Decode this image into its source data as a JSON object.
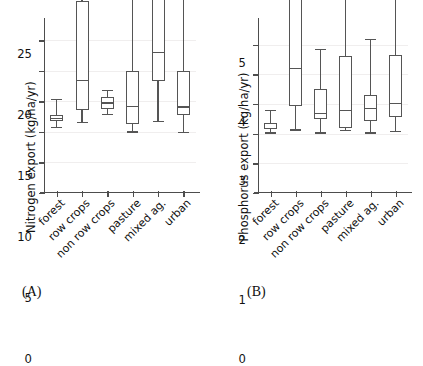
{
  "figure": {
    "background": "#ffffff",
    "line_color": "#555555",
    "grid_color": "#f0eeee"
  },
  "panels": [
    {
      "caption": "(A)",
      "ylabel": "Nitrogen export (kg/ha/yr)",
      "yticks": [
        "0",
        "5",
        "10",
        "15",
        "20",
        "25"
      ]
    },
    {
      "caption": "(B)",
      "ylabel": "Phosphorus export (kg/ha/yr)",
      "yticks": [
        "0",
        "1",
        "2",
        "3",
        "4",
        "5"
      ]
    }
  ],
  "chart_data": [
    {
      "type": "boxplot",
      "panel": "(A)",
      "title": "",
      "xlabel": "",
      "ylabel": "Nitrogen export (kg/ha/yr)",
      "ylim": [
        0,
        27.2
      ],
      "yticks": [
        0,
        5,
        10,
        15,
        20,
        25
      ],
      "grid": true,
      "categories": [
        "forest",
        "row crops",
        "non row crops",
        "pasture",
        "mixed ag.",
        "urban"
      ],
      "boxes": [
        {
          "category": "forest",
          "whisker_low": 1.05,
          "q1": 1.95,
          "median": 2.45,
          "q3": 2.95,
          "whisker_high": 5.55,
          "annotation": ""
        },
        {
          "category": "row crops",
          "whisker_low": 1.8,
          "q1": 3.7,
          "median": 8.7,
          "q3": 21.6,
          "whisker_high": 79.6,
          "annotation": "79.6"
        },
        {
          "category": "non row crops",
          "whisker_low": 3.15,
          "q1": 3.95,
          "median": 5.0,
          "q3": 5.9,
          "whisker_high": 7.0,
          "annotation": ""
        },
        {
          "category": "pasture",
          "whisker_low": 0.25,
          "q1": 1.55,
          "median": 4.5,
          "q3": 10.2,
          "whisker_high": 30.85,
          "annotation": "30.85"
        },
        {
          "category": "mixed ag.",
          "whisker_low": 2.0,
          "q1": 8.5,
          "median": 13.3,
          "q3": 24.8,
          "whisker_high": 41.5,
          "annotation": "41.50"
        },
        {
          "category": "urban",
          "whisker_low": 0.15,
          "q1": 2.95,
          "median": 4.35,
          "q3": 10.1,
          "whisker_high": 38.47,
          "annotation": "38.47"
        }
      ]
    },
    {
      "type": "boxplot",
      "panel": "(B)",
      "title": "",
      "xlabel": "",
      "ylabel": "Phosphorus export (kg/ha/yr)",
      "ylim": [
        0,
        5.6
      ],
      "yticks": [
        0,
        1,
        2,
        3,
        4,
        5
      ],
      "grid": true,
      "categories": [
        "forest",
        "row crops",
        "non row crops",
        "pasture",
        "mixed ag.",
        "urban"
      ],
      "boxes": [
        {
          "category": "forest",
          "whisker_low": 0.02,
          "q1": 0.12,
          "median": 0.18,
          "q3": 0.34,
          "whisker_high": 0.78,
          "annotation": ""
        },
        {
          "category": "row crops",
          "whisker_low": 0.12,
          "q1": 0.9,
          "median": 2.18,
          "q3": 5.28,
          "whisker_high": 18.6,
          "annotation": "18.6"
        },
        {
          "category": "non row crops",
          "whisker_low": 0.02,
          "q1": 0.46,
          "median": 0.68,
          "q3": 1.5,
          "whisker_high": 2.85,
          "annotation": ""
        },
        {
          "category": "pasture",
          "whisker_low": 0.1,
          "q1": 0.18,
          "median": 0.78,
          "q3": 2.6,
          "whisker_high": 4.85,
          "annotation": ""
        },
        {
          "category": "mixed ag.",
          "whisker_low": 0.02,
          "q1": 0.42,
          "median": 0.85,
          "q3": 1.28,
          "whisker_high": 3.17,
          "annotation": ""
        },
        {
          "category": "urban",
          "whisker_low": 0.06,
          "q1": 0.55,
          "median": 1.0,
          "q3": 2.62,
          "whisker_high": 6.23,
          "annotation": "6.23"
        }
      ]
    }
  ]
}
